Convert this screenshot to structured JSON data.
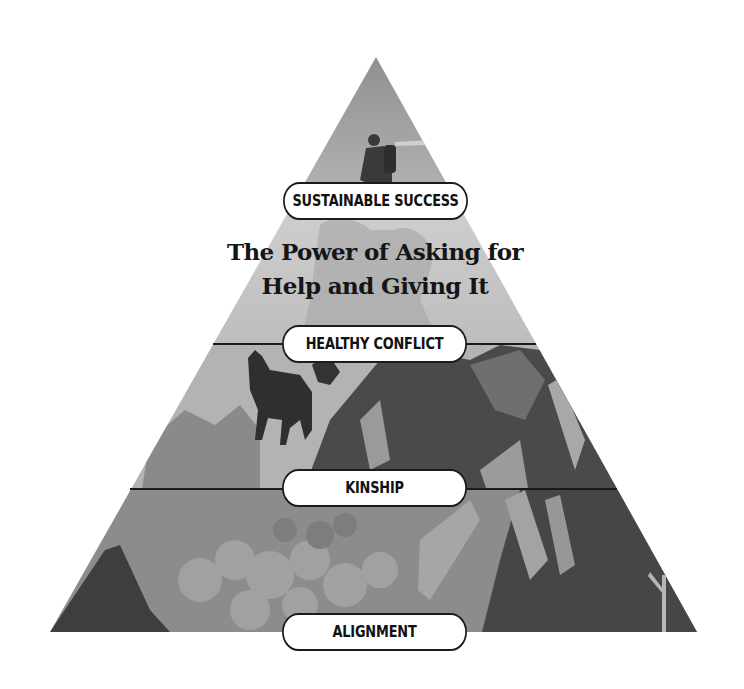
{
  "diagram": {
    "type": "pyramid",
    "title_line_1": "The Power of Asking for",
    "title_line_2": "Help and Giving It",
    "levels": [
      {
        "label": "SUSTAINABLE SUCCESS",
        "position": "top"
      },
      {
        "label": "HEALTHY CONFLICT",
        "position": "upper-middle"
      },
      {
        "label": "KINSHIP",
        "position": "lower-middle"
      },
      {
        "label": "ALIGNMENT",
        "position": "base"
      }
    ],
    "illustration": {
      "subjects": [
        "hiker-silhouette",
        "wolf-silhouette",
        "climber-silhouette",
        "mountains",
        "clouds"
      ],
      "palette": {
        "light": "#c9c9c9",
        "mid": "#8f8f8f",
        "dark": "#3d3d3d",
        "line": "#1c1c1c"
      }
    }
  }
}
